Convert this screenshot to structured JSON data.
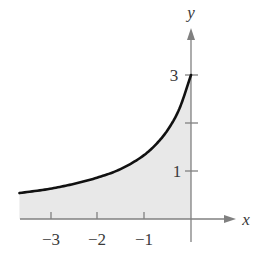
{
  "chart_data": {
    "type": "area",
    "title": "",
    "xlabel": "x",
    "ylabel": "y",
    "xlim": [
      -3.65,
      0.9
    ],
    "ylim": [
      -0.45,
      4.0
    ],
    "grid": false,
    "legend": null,
    "x_ticks": [
      -3,
      -2,
      -1
    ],
    "x_tick_labels": [
      "−3",
      "−2",
      "−1"
    ],
    "y_ticks": [
      1,
      2,
      3
    ],
    "y_tick_labels": [
      "1",
      "",
      "3"
    ],
    "curve_description": "Decreasing-to-the-left curve, shaded region between curve and x-axis for x <= 0",
    "series": [
      {
        "name": "f(x)",
        "x": [
          -3.65,
          -3.0,
          -2.5,
          -2.0,
          -1.5,
          -1.0,
          -0.75,
          -0.5,
          -0.25,
          0.0
        ],
        "values": [
          0.54,
          0.63,
          0.73,
          0.86,
          1.04,
          1.33,
          1.55,
          1.85,
          2.29,
          3.0
        ]
      }
    ],
    "shaded_region": {
      "from_x": -3.65,
      "to_x": 0,
      "between": [
        "curve",
        "x-axis"
      ],
      "color": "#e8e8e8"
    }
  },
  "axes": {
    "x_label": "x",
    "y_label": "y",
    "x_tick_labels": [
      "−3",
      "−2",
      "−1"
    ],
    "y_tick_labels": {
      "one": "1",
      "three": "3"
    }
  },
  "colors": {
    "curve": "#111111",
    "fill": "#e8e8e8",
    "axis": "#808080",
    "text": "#3a3a3a"
  }
}
